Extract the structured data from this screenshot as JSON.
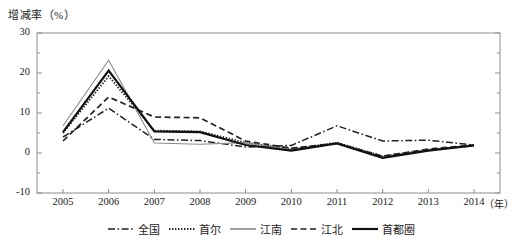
{
  "chart_data": {
    "type": "line",
    "title": "",
    "ylabel": "增减率（%）",
    "xlabel": "（年）",
    "x": [
      2005,
      2006,
      2007,
      2008,
      2009,
      2010,
      2011,
      2012,
      2013,
      2014
    ],
    "categories": [
      "2005",
      "2006",
      "2007",
      "2008",
      "2009",
      "2010",
      "2011",
      "2012",
      "2013",
      "2014"
    ],
    "ylim": [
      -10,
      30
    ],
    "yticks": [
      30,
      20,
      10,
      0,
      -10
    ],
    "ytick_labels": [
      "30",
      "20",
      "10",
      "0",
      "-10"
    ],
    "minor_yticks": [
      25,
      15,
      5,
      -5
    ],
    "grid": false,
    "legend_position": "bottom",
    "series": [
      {
        "name": "全国",
        "style": "dash-dot",
        "color": "#222222",
        "values": [
          4.0,
          11.2,
          3.4,
          3.1,
          1.5,
          1.9,
          6.8,
          3.0,
          3.2,
          2.0
        ]
      },
      {
        "name": "首尔",
        "style": "dotted",
        "color": "#222222",
        "values": [
          5.0,
          19.2,
          5.6,
          5.4,
          2.6,
          1.0,
          2.6,
          -0.8,
          0.8,
          1.8
        ]
      },
      {
        "name": "江南",
        "style": "solid-thin",
        "color": "#8a8a8a",
        "values": [
          6.8,
          23.2,
          2.5,
          2.2,
          2.6,
          0.8,
          2.4,
          -0.9,
          0.8,
          1.8
        ]
      },
      {
        "name": "江北",
        "style": "dashed",
        "color": "#222222",
        "values": [
          3.0,
          14.0,
          9.0,
          8.8,
          3.0,
          1.2,
          2.4,
          -0.8,
          1.0,
          2.0
        ]
      },
      {
        "name": "首都圈",
        "style": "solid-thick",
        "color": "#111111",
        "values": [
          5.2,
          20.6,
          5.4,
          5.2,
          2.0,
          0.6,
          2.4,
          -1.2,
          0.6,
          1.9
        ]
      }
    ]
  },
  "legend": {
    "items": [
      {
        "label": "全国"
      },
      {
        "label": "首尔"
      },
      {
        "label": "江南"
      },
      {
        "label": "江北"
      },
      {
        "label": "首都圈"
      }
    ]
  }
}
